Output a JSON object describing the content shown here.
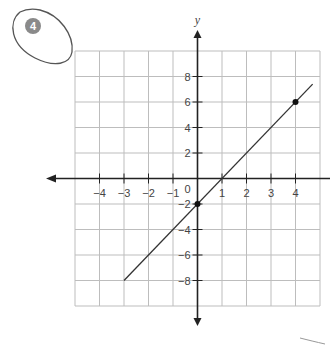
{
  "problem": {
    "number": "4",
    "badge_color": "#8a8a8a",
    "outline_color": "#555555"
  },
  "chart_data": {
    "type": "line",
    "title": "",
    "xlabel": "",
    "ylabel": "y",
    "xlim": [
      -5,
      5
    ],
    "ylim": [
      -10,
      10
    ],
    "grid": true,
    "x_ticks": [
      -4,
      -3,
      -2,
      -1,
      1,
      2,
      3,
      4
    ],
    "y_ticks": [
      8,
      6,
      4,
      2,
      -2,
      -4,
      -6,
      -8
    ],
    "origin_label": "0",
    "series": [
      {
        "name": "line",
        "equation": "y = 2x - 2",
        "x": [
          -3,
          4.7
        ],
        "y": [
          -8,
          7.4
        ],
        "marked_points": [
          {
            "x": 0,
            "y": -2
          },
          {
            "x": 4,
            "y": 6
          }
        ]
      }
    ]
  },
  "colors": {
    "grid": "#bdbdbd",
    "axis": "#222222",
    "line": "#333333"
  }
}
